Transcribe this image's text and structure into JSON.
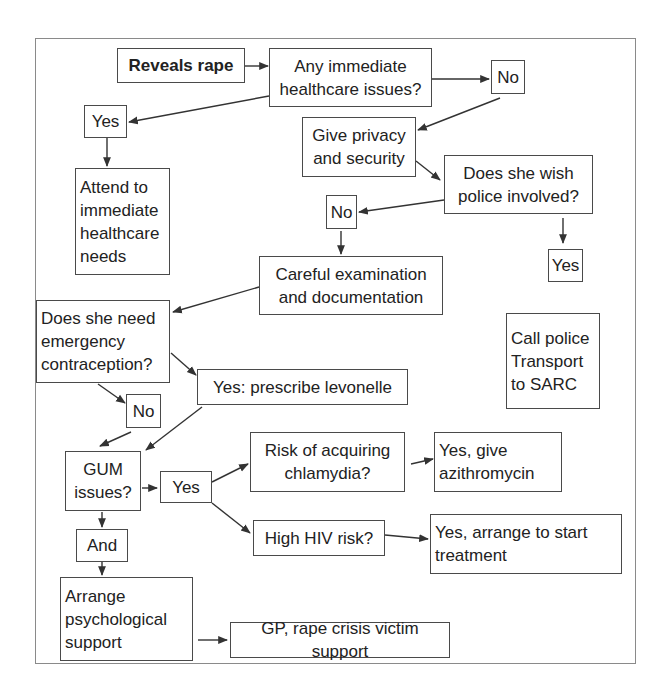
{
  "diagram": {
    "type": "flowchart",
    "colors": {
      "background": "#ffffff",
      "stroke": "#4a4a4a",
      "text": "#222222",
      "frame": "#8a8a8a"
    },
    "nodes": {
      "reveals_rape": {
        "label": "Reveals rape",
        "bold": true,
        "box": [
          117,
          48,
          128,
          35
        ]
      },
      "any_immediate": {
        "label": "Any immediate\nhealthcare issues?",
        "box": [
          269,
          48,
          163,
          59
        ]
      },
      "no_1": {
        "label": "No",
        "box": [
          491,
          60,
          34,
          34
        ]
      },
      "yes_1": {
        "label": "Yes",
        "box": [
          84,
          105,
          43,
          33
        ]
      },
      "give_privacy": {
        "label": "Give privacy\nand security",
        "box": [
          302,
          117,
          114,
          60
        ]
      },
      "attend_needs": {
        "label": "Attend to\nimmediate\nhealthcare\nneeds",
        "box": [
          75,
          168,
          95,
          107
        ]
      },
      "wish_police": {
        "label": "Does she wish\npolice involved?",
        "box": [
          444,
          155,
          149,
          59
        ]
      },
      "no_2": {
        "label": "No",
        "box": [
          326,
          195,
          31,
          34
        ]
      },
      "yes_2": {
        "label": "Yes",
        "box": [
          548,
          249,
          35,
          33
        ]
      },
      "careful_exam": {
        "label": "Careful examination\nand documentation",
        "box": [
          259,
          256,
          184,
          59
        ]
      },
      "emergency_contraception": {
        "label": "Does she need\nemergency\ncontraception?",
        "box": [
          36,
          300,
          134,
          83
        ]
      },
      "call_police": {
        "label": "Call police\nTransport\nto SARC",
        "box": [
          506,
          313,
          94,
          96
        ]
      },
      "prescribe_levonelle": {
        "label": "Yes: prescribe levonelle",
        "box": [
          197,
          369,
          211,
          36
        ]
      },
      "no_3": {
        "label": "No",
        "box": [
          126,
          394,
          35,
          34
        ]
      },
      "gum_issues": {
        "label": "GUM\nissues?",
        "box": [
          65,
          451,
          76,
          60
        ]
      },
      "yes_3": {
        "label": "Yes",
        "box": [
          160,
          471,
          52,
          32
        ]
      },
      "risk_chlamydia": {
        "label": "Risk of acquiring\nchlamydia?",
        "box": [
          250,
          432,
          155,
          60
        ]
      },
      "give_azithromycin": {
        "label": "Yes, give\nazithromycin",
        "box": [
          434,
          432,
          128,
          60
        ]
      },
      "high_hiv": {
        "label": "High HIV risk?",
        "box": [
          253,
          520,
          132,
          36
        ]
      },
      "start_treatment": {
        "label": "Yes, arrange to start\ntreatment",
        "box": [
          430,
          514,
          192,
          60
        ]
      },
      "and": {
        "label": "And",
        "box": [
          76,
          529,
          52,
          33
        ]
      },
      "psych_support": {
        "label": "Arrange\npsychological\nsupport",
        "box": [
          60,
          577,
          133,
          84
        ]
      },
      "gp_support": {
        "label": "GP, rape crisis victim support",
        "box": [
          230,
          622,
          220,
          36
        ]
      }
    },
    "edges": [
      {
        "from": "reveals_rape",
        "to": "any_immediate",
        "points": [
          [
            245,
            66
          ],
          [
            268,
            66
          ]
        ]
      },
      {
        "from": "any_immediate",
        "to": "no_1",
        "points": [
          [
            432,
            79
          ],
          [
            489,
            79
          ]
        ]
      },
      {
        "from": "any_immediate",
        "to": "yes_1",
        "points": [
          [
            269,
            96
          ],
          [
            129,
            122
          ]
        ]
      },
      {
        "from": "no_1",
        "to": "give_privacy",
        "points": [
          [
            500,
            98
          ],
          [
            418,
            130
          ]
        ]
      },
      {
        "from": "yes_1",
        "to": "attend_needs",
        "points": [
          [
            107,
            138
          ],
          [
            107,
            166
          ]
        ]
      },
      {
        "from": "give_privacy",
        "to": "wish_police",
        "points": [
          [
            416,
            161
          ],
          [
            440,
            180
          ]
        ]
      },
      {
        "from": "wish_police",
        "to": "no_2",
        "points": [
          [
            444,
            200
          ],
          [
            359,
            212
          ]
        ]
      },
      {
        "from": "wish_police",
        "to": "yes_2",
        "points": [
          [
            563,
            218
          ],
          [
            563,
            243
          ]
        ]
      },
      {
        "from": "no_2",
        "to": "careful_exam",
        "points": [
          [
            341,
            231
          ],
          [
            341,
            254
          ]
        ]
      },
      {
        "from": "careful_exam",
        "to": "emergency_contraception",
        "points": [
          [
            259,
            287
          ],
          [
            173,
            312
          ]
        ]
      },
      {
        "from": "emergency_contraception",
        "to": "prescribe_levonelle",
        "points": [
          [
            171,
            353
          ],
          [
            196,
            375
          ]
        ]
      },
      {
        "from": "emergency_contraception",
        "to": "no_3",
        "points": [
          [
            98,
            384
          ],
          [
            125,
            403
          ]
        ]
      },
      {
        "from": "no_3",
        "to": "gum_issues",
        "points": [
          [
            131,
            432
          ],
          [
            100,
            446
          ]
        ]
      },
      {
        "from": "prescribe_levonelle",
        "to": "gum_issues",
        "points": [
          [
            202,
            407
          ],
          [
            146,
            450
          ]
        ]
      },
      {
        "from": "gum_issues",
        "to": "yes_3",
        "points": [
          [
            142,
            488
          ],
          [
            157,
            488
          ]
        ]
      },
      {
        "from": "yes_3",
        "to": "risk_chlamydia",
        "points": [
          [
            212,
            482
          ],
          [
            248,
            464
          ]
        ]
      },
      {
        "from": "yes_3",
        "to": "high_hiv",
        "points": [
          [
            212,
            503
          ],
          [
            250,
            533
          ]
        ]
      },
      {
        "from": "risk_chlamydia",
        "to": "give_azithromycin",
        "points": [
          [
            411,
            464
          ],
          [
            433,
            459
          ]
        ]
      },
      {
        "from": "high_hiv",
        "to": "start_treatment",
        "points": [
          [
            385,
            535
          ],
          [
            428,
            539
          ]
        ]
      },
      {
        "from": "gum_issues",
        "to": "and",
        "points": [
          [
            102,
            512
          ],
          [
            102,
            527
          ]
        ]
      },
      {
        "from": "and",
        "to": "psych_support",
        "points": [
          [
            102,
            562
          ],
          [
            102,
            575
          ]
        ]
      },
      {
        "from": "psych_support",
        "to": "gp_support",
        "points": [
          [
            198,
            640
          ],
          [
            227,
            640
          ]
        ]
      }
    ]
  }
}
